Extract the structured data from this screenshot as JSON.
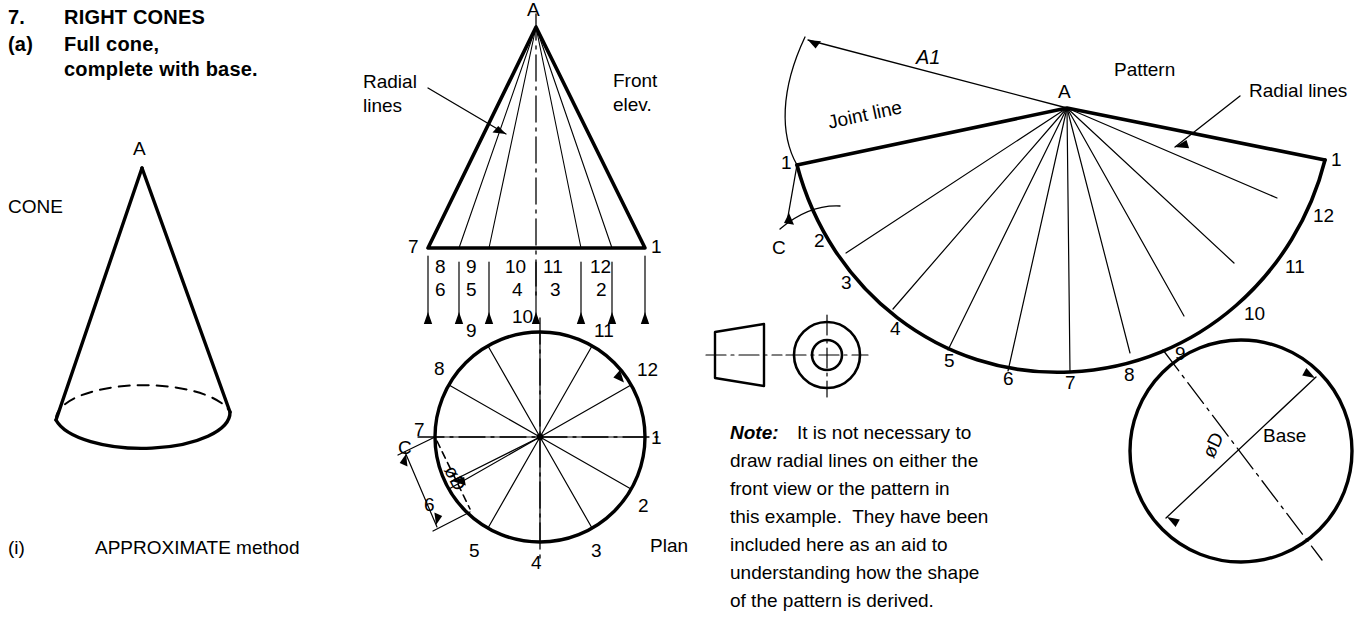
{
  "heading": {
    "number": "7.",
    "title": "RIGHT CONES",
    "sub_marker": "(a)",
    "sub_line1": "Full cone,",
    "sub_line2": "complete with base."
  },
  "pictorial": {
    "apex_label": "A",
    "caption": "CONE"
  },
  "method": {
    "marker": "(i)",
    "label": "APPROXIMATE method"
  },
  "front_elevation": {
    "apex_label": "A",
    "view_label_line1": "Front",
    "view_label_line2": "elev.",
    "radial_label_line1": "Radial",
    "radial_label_line2": "lines",
    "base_left_number": "7",
    "base_right_number": "1",
    "top_numbers": [
      "8",
      "9",
      "10",
      "11",
      "12"
    ],
    "bottom_numbers": [
      "6",
      "5",
      "4",
      "3",
      "2"
    ]
  },
  "plan": {
    "view_label": "Plan",
    "diameter_label": "øD",
    "chord_label": "C",
    "point_numbers": [
      "1",
      "2",
      "3",
      "4",
      "5",
      "6",
      "7",
      "8",
      "9",
      "10",
      "11",
      "12"
    ]
  },
  "pattern": {
    "view_label": "Pattern",
    "apex_label": "A",
    "joint_line_label": "Joint line",
    "radial_lines_label": "Radial lines",
    "slant_dim_label": "A1",
    "chord_dim_label": "C",
    "left_point": "1",
    "right_point": "1",
    "arc_numbers": [
      "2",
      "3",
      "4",
      "5",
      "6",
      "7",
      "8",
      "9",
      "10",
      "11",
      "12"
    ]
  },
  "base": {
    "label": "Base",
    "diameter_label": "øD"
  },
  "note": {
    "prefix": "Note:",
    "line1": "It is not necessary to",
    "line2": "draw radial lines on either the",
    "line3": "front view or the pattern in",
    "line4": "this example.  They have been",
    "line5": "included here as an aid to",
    "line6": "understanding how the shape",
    "line7": "of the pattern is derived."
  },
  "colors": {
    "ink": "#000000",
    "paper": "#ffffff"
  }
}
